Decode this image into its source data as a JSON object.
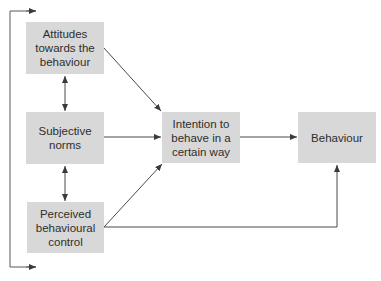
{
  "diagram": {
    "nodes": {
      "attitudes": {
        "label": "Attitudes towards the behaviour"
      },
      "subjective_norms": {
        "label": "Subjective norms"
      },
      "perceived_control": {
        "label": "Perceived behavioural control"
      },
      "intention": {
        "label": "Intention to behave in a certain way"
      },
      "behaviour": {
        "label": "Behaviour"
      }
    },
    "edges": [
      {
        "from": "attitudes",
        "to": "intention",
        "type": "directed"
      },
      {
        "from": "subjective_norms",
        "to": "intention",
        "type": "directed"
      },
      {
        "from": "perceived_control",
        "to": "intention",
        "type": "directed"
      },
      {
        "from": "intention",
        "to": "behaviour",
        "type": "directed"
      },
      {
        "from": "perceived_control",
        "to": "behaviour",
        "type": "directed"
      },
      {
        "from": "attitudes",
        "to": "subjective_norms",
        "type": "bidirectional"
      },
      {
        "from": "subjective_norms",
        "to": "perceived_control",
        "type": "bidirectional"
      },
      {
        "from": "attitudes",
        "to": "perceived_control",
        "type": "bidirectional-bracket"
      }
    ],
    "colors": {
      "box_fill": "#d8d8d8",
      "line": "#4a4a4a",
      "text": "#2e2e2e"
    }
  }
}
